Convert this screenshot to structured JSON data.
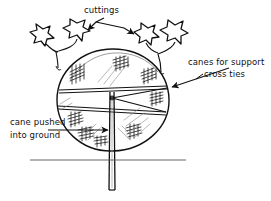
{
  "figure": {
    "kind": "hand-drawn-illustration",
    "background_color": "#ffffff",
    "ink_color": "#111111"
  },
  "labels": {
    "cuttings": "cuttings",
    "canes_for_support": "canes for support",
    "cross_ties": "cross ties",
    "cane_pushed_line1": "cane pushed",
    "cane_pushed_line2": "into ground"
  },
  "annotations": [
    {
      "name": "cuttings-annotation",
      "text": "cuttings",
      "text_x": 84,
      "text_y": 5,
      "leader_targets": [
        [
          86,
          32
        ],
        [
          134,
          34
        ]
      ]
    },
    {
      "name": "canes-support-annotation",
      "text": "canes for support",
      "text_x": 188,
      "text_y": 57,
      "leader_targets": [
        [
          164,
          89
        ]
      ]
    },
    {
      "name": "cross-ties-annotation",
      "text": "cross ties",
      "text_x": 204,
      "text_y": 69,
      "leader_targets": [
        [
          164,
          89
        ]
      ]
    },
    {
      "name": "cane-pushed-annotation",
      "text": "cane pushed into ground",
      "text_x": 10,
      "text_y": 117,
      "leader_targets": [
        [
          112,
          130
        ]
      ]
    }
  ],
  "drawing": {
    "pot_rim": {
      "center_x": 113,
      "center_y": 100,
      "radius_x": 56,
      "radius_y": 51
    },
    "center_hub": {
      "x": 112,
      "y": 98
    },
    "cross_ties_count": 3,
    "ground_line": {
      "x1": 30,
      "y1": 160,
      "x2": 186,
      "y2": 160
    },
    "main_cane": {
      "top_y": 92,
      "bottom_y": 190,
      "x": 112
    },
    "cuttings_count": 4,
    "cutting_positions": [
      {
        "x": 42,
        "y": 36
      },
      {
        "x": 76,
        "y": 30
      },
      {
        "x": 146,
        "y": 33
      },
      {
        "x": 175,
        "y": 38
      }
    ]
  }
}
